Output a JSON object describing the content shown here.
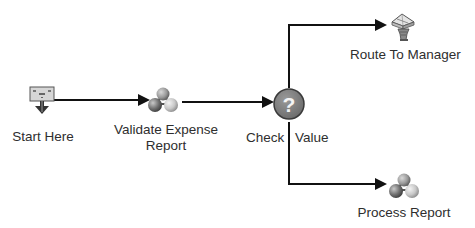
{
  "diagram": {
    "type": "workflow",
    "colors": {
      "line": "#111111",
      "decision_fill": "#7a7a7a",
      "decision_stroke": "#3a3a3a",
      "label_text": "#2e2e2e"
    },
    "nodes": [
      {
        "id": "start",
        "icon": "start-terminal-icon",
        "label": "Start Here"
      },
      {
        "id": "validate",
        "icon": "molecule-activity-icon",
        "label_line1": "Validate Expense",
        "label_line2": "Report"
      },
      {
        "id": "check",
        "icon": "question-decision-icon",
        "glyph": "?",
        "label_left": "Check",
        "label_right": "Value"
      },
      {
        "id": "route",
        "icon": "manager-routing-icon",
        "label": "Route To Manager"
      },
      {
        "id": "process",
        "icon": "molecule-activity-icon",
        "label": "Process Report"
      }
    ],
    "edges": [
      {
        "from": "start",
        "to": "validate"
      },
      {
        "from": "validate",
        "to": "check"
      },
      {
        "from": "check",
        "to": "route"
      },
      {
        "from": "check",
        "to": "process"
      }
    ]
  }
}
